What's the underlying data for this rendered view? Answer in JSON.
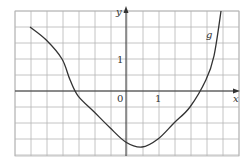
{
  "chart_data": {
    "type": "line",
    "title": "",
    "xlabel": "x",
    "ylabel": "y",
    "function_label": "g",
    "origin_label": "0",
    "x_tick_label": "1",
    "y_tick_label": "1",
    "grid": true,
    "grid_step": 0.5,
    "xlim": [
      -3.5,
      3.5
    ],
    "ylim": [
      -2.0,
      2.5
    ],
    "series": [
      {
        "name": "g",
        "x": [
          -3.0,
          -2.5,
          -2.0,
          -1.75,
          -1.5,
          -1.0,
          -0.5,
          0.0,
          0.5,
          1.0,
          1.5,
          2.0,
          2.5,
          2.75,
          2.97
        ],
        "y": [
          2.0,
          1.6,
          1.0,
          0.35,
          -0.15,
          -0.65,
          -1.15,
          -1.6,
          -1.75,
          -1.5,
          -1.0,
          -0.5,
          0.35,
          1.1,
          2.5
        ]
      }
    ],
    "colors": {
      "curve": "#333333",
      "grid": "#b0b0b0",
      "axis": "#333333"
    }
  }
}
